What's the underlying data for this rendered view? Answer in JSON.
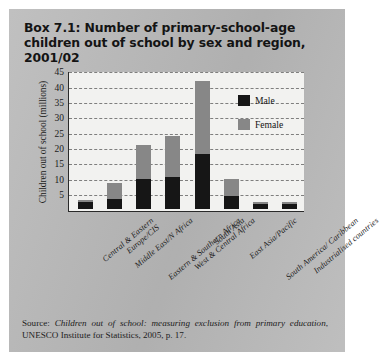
{
  "box": {
    "title": "Box 7.1: Number of primary-school-age children out of school by sex and region, 2001/02",
    "source_prefix": "Source: ",
    "source_italic": "Children out of school: measuring exclusion from primary education",
    "source_rest": ", UNESCO Institute for Statistics, 2005, p. 17."
  },
  "chart_data": {
    "type": "bar",
    "stacked": true,
    "title": "Number of primary-school-age children out of school by sex and region, 2001/02",
    "xlabel": "",
    "ylabel": "Children out of school (millions)",
    "ylim": [
      0,
      45
    ],
    "yticks": [
      45,
      40,
      35,
      30,
      25,
      20,
      15,
      10,
      5
    ],
    "grid": true,
    "legend_position": "inside-top-right",
    "categories": [
      "Central & Eastern Europe/CIS",
      "Middle East/N Africa",
      "Eastern & Southern Africa",
      "West & Central Africa",
      "South Asia",
      "East Asia/Pacific",
      "South America/Caribbean",
      "Industrialised countries"
    ],
    "category_lines": [
      [
        "Central & Eastern",
        "Europe/CIS"
      ],
      [
        "Middle East/N Africa"
      ],
      [
        "Eastern & Southern Africa"
      ],
      [
        "West & Central Africa"
      ],
      [
        "South Asia"
      ],
      [
        "East Asia/Pacific"
      ],
      [
        "South America/ Caribbean"
      ],
      [
        "Industrialised countries"
      ]
    ],
    "series": [
      {
        "name": "Male",
        "color": "#161616",
        "values": [
          2.5,
          3.5,
          10.0,
          10.5,
          18.0,
          4.5,
          1.8,
          1.8
        ]
      },
      {
        "name": "Female",
        "color": "#878787",
        "values": [
          0.5,
          5.0,
          11.0,
          13.5,
          24.0,
          5.5,
          0.5,
          0.5
        ]
      }
    ],
    "totals": [
      3.0,
      8.5,
      21.0,
      24.0,
      42.0,
      10.0,
      2.3,
      2.3
    ]
  },
  "legend": {
    "male_label": "Male",
    "female_label": "Female"
  }
}
